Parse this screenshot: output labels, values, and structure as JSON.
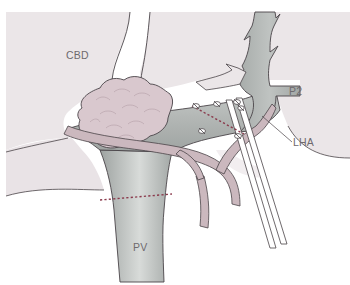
{
  "figure": {
    "type": "anatomical-surgical-illustration",
    "labels": {
      "cbd": "CBD",
      "p2": "P2",
      "lha": "LHA",
      "pv": "PV"
    },
    "colors": {
      "background": "#ffffff",
      "liver_parenchyma": "#ebe6e8",
      "portal_vein": "#a9adab",
      "portal_vein_highlight": "#d6d9d7",
      "artery": "#cbb8be",
      "tumor_mass": "#d9c8ce",
      "outline": "#4a4448",
      "dotted_transection_line": "#8a3a4c",
      "label_text": "#6e6a6e"
    },
    "annotations": {
      "transection_lines": 2,
      "suture_ligatures": 6,
      "instrument_taped_vessel_loops": 2
    }
  }
}
